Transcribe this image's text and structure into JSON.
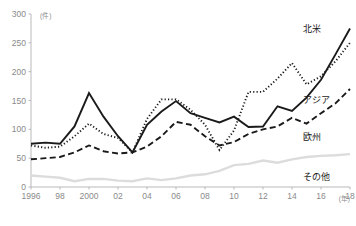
{
  "chart_data": {
    "type": "line",
    "title": "",
    "xlabel": "(年)",
    "ylabel": "(件)",
    "xlim": [
      1996,
      2018
    ],
    "ylim": [
      0,
      300
    ],
    "grid": false,
    "legend_position": "inline-right",
    "x": [
      1996,
      1997,
      1998,
      1999,
      2000,
      2001,
      2002,
      2003,
      2004,
      2005,
      2006,
      2007,
      2008,
      2009,
      2010,
      2011,
      2012,
      2013,
      2014,
      2015,
      2016,
      2017,
      2018
    ],
    "xticks": [
      "1996",
      "98",
      "2000",
      "02",
      "04",
      "06",
      "08",
      "10",
      "12",
      "14",
      "16",
      "18"
    ],
    "xtick_values": [
      1996,
      1998,
      2000,
      2002,
      2004,
      2006,
      2008,
      2010,
      2012,
      2014,
      2016,
      2018
    ],
    "yticks": [
      "0",
      "50",
      "100",
      "150",
      "200",
      "250",
      "300"
    ],
    "ytick_values": [
      0,
      50,
      100,
      150,
      200,
      250,
      300
    ],
    "series": [
      {
        "name": "北米",
        "label": "北米",
        "style": "solid",
        "color": "#1a1a1a",
        "width": 1.9,
        "values": [
          75,
          77,
          75,
          105,
          163,
          122,
          88,
          60,
          108,
          131,
          149,
          128,
          120,
          112,
          122,
          104,
          105,
          140,
          132,
          155,
          186,
          230,
          275
        ]
      },
      {
        "name": "アジア",
        "label": "アジア",
        "style": "dotted",
        "color": "#1a1a1a",
        "width": 1.9,
        "values": [
          72,
          68,
          70,
          88,
          110,
          92,
          85,
          60,
          118,
          152,
          152,
          134,
          108,
          64,
          98,
          165,
          165,
          188,
          215,
          178,
          192,
          218,
          250
        ]
      },
      {
        "name": "欧州",
        "label": "欧州",
        "style": "dashed",
        "color": "#1a1a1a",
        "width": 1.9,
        "values": [
          48,
          50,
          52,
          60,
          72,
          62,
          58,
          60,
          70,
          88,
          113,
          108,
          88,
          72,
          78,
          92,
          100,
          105,
          120,
          110,
          128,
          145,
          170
        ]
      },
      {
        "name": "その他",
        "label": "その他",
        "style": "solid",
        "color": "#dcdcdc",
        "width": 2.4,
        "values": [
          20,
          18,
          16,
          10,
          14,
          14,
          11,
          10,
          15,
          12,
          15,
          20,
          22,
          28,
          38,
          40,
          46,
          42,
          48,
          52,
          54,
          55,
          57
        ]
      }
    ]
  }
}
